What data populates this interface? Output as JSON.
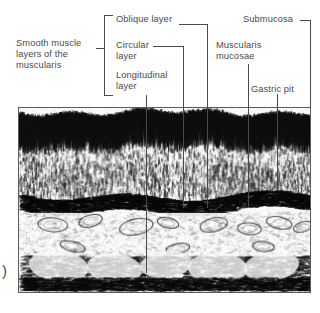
{
  "figure": {
    "paren_mark": ")",
    "ink_color": "#4a4a4a",
    "frame_color": "#5a5a5a"
  },
  "labels": [
    {
      "id": "smooth-muscle-group",
      "text": "Smooth muscle\nlayers of the\nmuscularis",
      "x": 16,
      "y": 38
    },
    {
      "id": "oblique-layer",
      "text": "Oblique layer",
      "x": 116,
      "y": 14
    },
    {
      "id": "circular-layer",
      "text": "Circular\nlayer",
      "x": 116,
      "y": 40
    },
    {
      "id": "longitudinal-layer",
      "text": "Longitudinal\nlayer",
      "x": 116,
      "y": 70
    },
    {
      "id": "muscularis-mucosae",
      "text": "Muscularis\nmucosae",
      "x": 216,
      "y": 40
    },
    {
      "id": "submucosa",
      "text": "Submucosa",
      "x": 243,
      "y": 14
    },
    {
      "id": "gastric-pit",
      "text": "Gastric pit",
      "x": 251,
      "y": 84
    }
  ],
  "leaders": [
    {
      "id": "oblique-leader-h",
      "x": 179,
      "y": 24,
      "w": 29,
      "orient": "h"
    },
    {
      "id": "oblique-leader-v",
      "x": 207,
      "y": 24,
      "h": 84,
      "orient": "v"
    },
    {
      "id": "circular-leader-h",
      "x": 153,
      "y": 46,
      "w": 31,
      "orient": "h"
    },
    {
      "id": "circular-leader-v",
      "x": 183,
      "y": 46,
      "h": 62,
      "orient": "v"
    },
    {
      "id": "longitudinal-leader-v",
      "x": 146,
      "y": 95,
      "h": 13,
      "orient": "v"
    },
    {
      "id": "muscularis-leader-v",
      "x": 248,
      "y": 64,
      "h": 44,
      "orient": "v"
    },
    {
      "id": "submucosa-leader-h",
      "x": 300,
      "y": 20,
      "w": 11,
      "orient": "h"
    },
    {
      "id": "submucosa-leader-v",
      "x": 310,
      "y": 20,
      "h": 88,
      "orient": "v"
    },
    {
      "id": "gastric-pit-leader-v",
      "x": 277,
      "y": 94,
      "h": 14,
      "orient": "v"
    }
  ],
  "bracket": {
    "id": "smooth-muscle-bracket",
    "x": 104,
    "y": 15,
    "h": 81,
    "stub_y": 33
  },
  "micrograph": {
    "id": "stomach-wall-micrograph",
    "x": 18,
    "y": 107,
    "w": 293,
    "h": 186,
    "inner_leaders": [
      {
        "id": "inner-leader-longitudinal",
        "x": 146
      },
      {
        "id": "inner-leader-circular",
        "x": 183
      },
      {
        "id": "inner-leader-oblique",
        "x": 207
      },
      {
        "id": "inner-leader-muscularis",
        "x": 248
      },
      {
        "id": "inner-leader-gastric-pit",
        "x": 277
      }
    ],
    "inner_leader_depths": {
      "inner-leader-longitudinal": 165,
      "inner-leader-circular": 100,
      "inner-leader-oblique": 100,
      "inner-leader-muscularis": 100,
      "inner-leader-gastric-pit": 80
    }
  },
  "paren": {
    "text": ")",
    "x": 2,
    "y": 262
  }
}
